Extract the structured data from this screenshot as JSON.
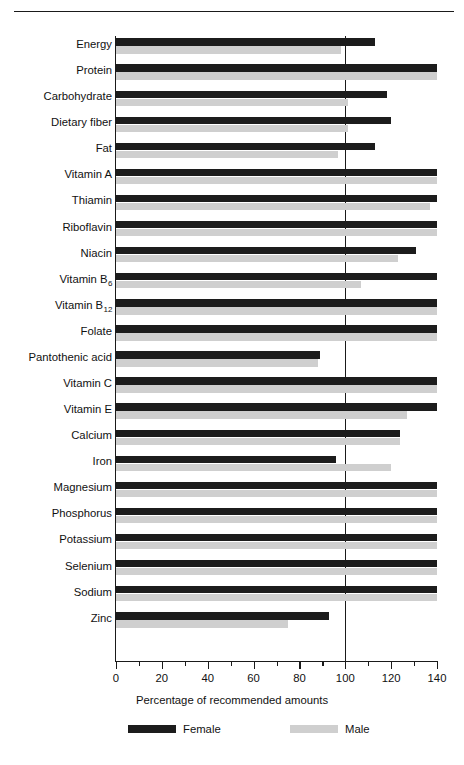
{
  "chart_data": {
    "type": "bar",
    "orientation": "horizontal",
    "title": "",
    "xlabel": "Percentage of recommended amounts",
    "ylabel": "",
    "xlim": [
      0,
      140
    ],
    "xticks": [
      0,
      20,
      40,
      60,
      80,
      100,
      120,
      140
    ],
    "xtick_labels": [
      "0",
      "20",
      "40",
      "60",
      "80",
      "100",
      "120",
      "140"
    ],
    "minor_tick_interval": 10,
    "grid": false,
    "reference_line": 100,
    "legend_position": "bottom",
    "legend": [
      "Female",
      "Male"
    ],
    "colors": {
      "female": "#1c1c1c",
      "male": "#cfcfcf",
      "axis": "#1a1a1a",
      "background": "#ffffff"
    },
    "categories": [
      "Energy",
      "Protein",
      "Carbohydrate",
      "Dietary fiber",
      "Fat",
      "Vitamin A",
      "Thiamin",
      "Riboflavin",
      "Niacin",
      "Vitamin B6",
      "Vitamin B12",
      "Folate",
      "Pantothenic acid",
      "Vitamin C",
      "Vitamin E",
      "Calcium",
      "Iron",
      "Magnesium",
      "Phosphorus",
      "Potassium",
      "Selenium",
      "Sodium",
      "Zinc"
    ],
    "category_labels_html": [
      "Energy",
      "Protein",
      "Carbohydrate",
      "Dietary fiber",
      "Fat",
      "Vitamin A",
      "Thiamin",
      "Riboflavin",
      "Niacin",
      "Vitamin B<sub>6</sub>",
      "Vitamin B<sub>12</sub>",
      "Folate",
      "Pantothenic acid",
      "Vitamin C",
      "Vitamin E",
      "Calcium",
      "Iron",
      "Magnesium",
      "Phosphorus",
      "Potassium",
      "Selenium",
      "Sodium",
      "Zinc"
    ],
    "series": [
      {
        "name": "Female",
        "color": "#1c1c1c",
        "values": [
          113,
          140,
          118,
          120,
          113,
          140,
          140,
          140,
          131,
          140,
          140,
          140,
          89,
          140,
          140,
          124,
          96,
          140,
          140,
          140,
          140,
          140,
          93
        ]
      },
      {
        "name": "Male",
        "color": "#cfcfcf",
        "values": [
          98,
          140,
          101,
          101,
          97,
          140,
          137,
          140,
          123,
          107,
          140,
          140,
          88,
          140,
          127,
          124,
          120,
          140,
          140,
          140,
          140,
          140,
          75
        ]
      }
    ]
  }
}
